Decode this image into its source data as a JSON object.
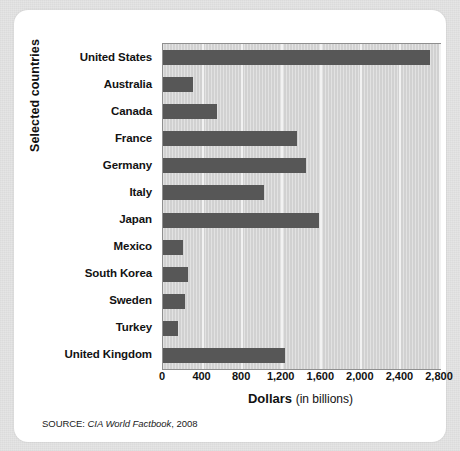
{
  "figure": {
    "source_prefix": "SOURCE:",
    "source_title": "CIA World Factbook",
    "source_year": ", 2008",
    "xlabel_main": "Dollars",
    "xlabel_sub": "(in billions)",
    "ylabel": "Selected countries"
  },
  "colors": {
    "bar_fill": "#575757",
    "plot_background": "#d3d3d3",
    "gridline": "#f2f2f2",
    "card_background": "#ffffff",
    "page_background": "#e4e4e4",
    "text": "#111111"
  },
  "chart_data": {
    "type": "bar",
    "orientation": "horizontal",
    "title": "",
    "subtitle": "",
    "xlabel": "Dollars (in billions)",
    "ylabel": "Selected countries",
    "categories": [
      "United States",
      "Australia",
      "Canada",
      "France",
      "Germany",
      "Italy",
      "Japan",
      "Mexico",
      "South Korea",
      "Sweden",
      "Turkey",
      "United Kingdom"
    ],
    "values": [
      2700,
      300,
      550,
      1350,
      1450,
      1020,
      1580,
      200,
      250,
      220,
      150,
      1230
    ],
    "xlim": [
      0,
      2800
    ],
    "xticks": [
      0,
      400,
      800,
      1200,
      1600,
      2000,
      2400,
      2800
    ],
    "xticklabels": [
      "0",
      "400",
      "800",
      "1,200",
      "1,600",
      "2,000",
      "2,400",
      "2,800"
    ],
    "grid": "vertical",
    "legend": null,
    "source": "SOURCE: CIA World Factbook, 2008"
  }
}
